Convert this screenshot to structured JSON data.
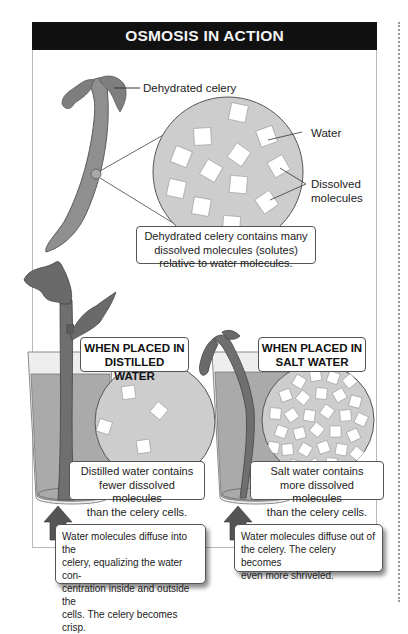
{
  "title": "OSMOSIS IN ACTION",
  "colors": {
    "title_bar": "#111111",
    "title_text": "#f4f4f4",
    "celery_fill": "#8a8a8a",
    "celery_stroke": "#555555",
    "water_fill": "#a9a9a9",
    "circle_fill": "#cfcfcf",
    "molecule_fill": "#ffffff",
    "arrow_fill": "#555555"
  },
  "top_panel": {
    "labels": {
      "celery": "Dehydrated celery",
      "water": "Water",
      "dissolved_line1": "Dissolved",
      "dissolved_line2": "molecules"
    },
    "caption": {
      "line1": "Dehydrated celery contains many",
      "line2": "dissolved molecules (solutes)",
      "line3": "relative to water molecules."
    },
    "molecule_count": 12
  },
  "left_panel": {
    "heading_line1": "WHEN PLACED IN",
    "heading_line2": "DISTILLED WATER",
    "caption": {
      "line1": "Distilled water contains",
      "line2": "fewer dissolved molecules",
      "line3": "than the celery cells."
    },
    "result": {
      "line1": "Water molecules diffuse into the",
      "line2": "celery, equalizing the water con-",
      "line3": "centration inside and outside the",
      "line4": "cells. The celery becomes crisp."
    },
    "molecule_count": 4
  },
  "right_panel": {
    "heading_line1": "WHEN PLACED IN",
    "heading_line2": "SALT WATER",
    "caption": {
      "line1": "Salt water contains",
      "line2": "more dissolved molecules",
      "line3": "than the celery cells."
    },
    "result": {
      "line1": "Water molecules diffuse out of",
      "line2": "the celery. The celery becomes",
      "line3": "even more shriveled."
    },
    "molecule_count": 30
  }
}
